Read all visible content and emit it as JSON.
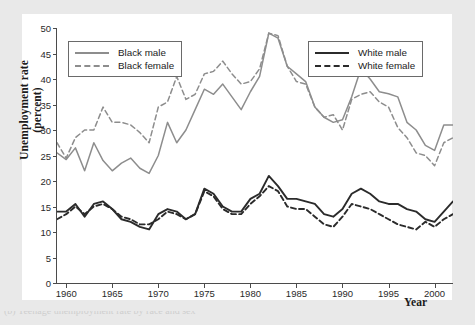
{
  "figure": {
    "ylabel_line1": "Unemployment rate",
    "ylabel_line2": "(percent)",
    "xlabel": "Year",
    "caption": "(b) Teenage unemployment rate by race and sex"
  },
  "legend_left": {
    "items": [
      {
        "label": "Black male",
        "style": "solid",
        "color": "#8d8d8d",
        "icon": "line-solid-gray-icon"
      },
      {
        "label": "Black female",
        "style": "dashed",
        "color": "#8d8d8d",
        "icon": "line-dashed-gray-icon"
      }
    ]
  },
  "legend_right": {
    "items": [
      {
        "label": "White male",
        "style": "solid",
        "color": "#2b2b2b",
        "icon": "line-solid-black-icon"
      },
      {
        "label": "White female",
        "style": "dashed",
        "color": "#2b2b2b",
        "icon": "line-dashed-black-icon"
      }
    ]
  },
  "chart_data": {
    "type": "line",
    "title": "",
    "subtitle": "",
    "xlabel": "Year",
    "ylabel": "Unemployment rate (percent)",
    "xlim": [
      1959,
      2002
    ],
    "ylim": [
      0,
      50
    ],
    "yticks": [
      0,
      5,
      10,
      15,
      20,
      25,
      30,
      35,
      40,
      45,
      50
    ],
    "xticks": [
      1960,
      1965,
      1970,
      1975,
      1980,
      1985,
      1990,
      1995,
      2000
    ],
    "grid": false,
    "legend_position": "inside-top-left, inside-top-right",
    "x": [
      1959,
      1960,
      1961,
      1962,
      1963,
      1964,
      1965,
      1966,
      1967,
      1968,
      1969,
      1970,
      1971,
      1972,
      1973,
      1974,
      1975,
      1976,
      1977,
      1978,
      1979,
      1980,
      1981,
      1982,
      1983,
      1984,
      1985,
      1986,
      1987,
      1988,
      1989,
      1990,
      1991,
      1992,
      1993,
      1994,
      1995,
      1996,
      1997,
      1998,
      1999,
      2000,
      2001,
      2002
    ],
    "series": [
      {
        "name": "Black male",
        "color": "#8d8d8d",
        "style": "solid",
        "values": [
          25.5,
          24.2,
          26.5,
          22.0,
          27.5,
          24.0,
          22.0,
          23.5,
          24.5,
          22.5,
          21.5,
          25.0,
          31.5,
          27.5,
          30.0,
          34.0,
          38.0,
          37.0,
          39.0,
          36.5,
          34.0,
          37.5,
          40.5,
          49.0,
          48.0,
          42.5,
          41.0,
          39.5,
          34.5,
          32.5,
          31.5,
          32.0,
          36.5,
          42.0,
          40.0,
          37.5,
          37.1,
          36.5,
          31.5,
          30.0,
          27.0,
          26.0,
          31.0,
          31.0
        ]
      },
      {
        "name": "Black female",
        "color": "#8d8d8d",
        "style": "dashed",
        "values": [
          27.5,
          24.5,
          28.5,
          30.0,
          30.0,
          34.5,
          31.5,
          31.5,
          31.0,
          29.5,
          27.5,
          34.5,
          35.5,
          40.5,
          36.0,
          37.0,
          41.0,
          41.5,
          43.5,
          41.0,
          39.0,
          39.5,
          42.0,
          49.0,
          48.5,
          42.5,
          39.5,
          39.0,
          34.5,
          32.5,
          33.0,
          30.0,
          36.0,
          37.0,
          37.5,
          35.5,
          34.5,
          30.5,
          28.5,
          25.5,
          25.0,
          23.0,
          27.5,
          28.5
        ]
      },
      {
        "name": "White male",
        "color": "#2b2b2b",
        "style": "solid",
        "values": [
          14.0,
          14.0,
          15.5,
          13.0,
          15.5,
          16.0,
          14.5,
          12.5,
          12.0,
          11.0,
          10.5,
          13.5,
          14.5,
          14.0,
          12.5,
          13.5,
          18.5,
          17.5,
          15.0,
          14.0,
          14.0,
          16.5,
          17.5,
          21.0,
          19.0,
          16.5,
          16.5,
          16.0,
          15.5,
          13.5,
          13.0,
          14.5,
          17.5,
          18.5,
          17.5,
          16.0,
          15.5,
          15.5,
          14.5,
          14.0,
          12.5,
          12.0,
          14.0,
          16.0
        ]
      },
      {
        "name": "White female",
        "color": "#2b2b2b",
        "style": "dashed",
        "values": [
          12.5,
          13.5,
          15.0,
          13.5,
          15.0,
          15.5,
          14.5,
          13.0,
          12.5,
          11.5,
          11.5,
          12.5,
          14.0,
          13.5,
          12.5,
          13.5,
          18.0,
          17.0,
          14.5,
          13.5,
          13.5,
          15.5,
          17.0,
          19.0,
          18.0,
          15.0,
          14.5,
          14.5,
          13.0,
          11.5,
          11.0,
          13.0,
          15.5,
          15.0,
          14.5,
          13.5,
          12.5,
          11.5,
          11.0,
          10.5,
          12.0,
          11.0,
          12.5,
          13.5
        ]
      }
    ]
  }
}
